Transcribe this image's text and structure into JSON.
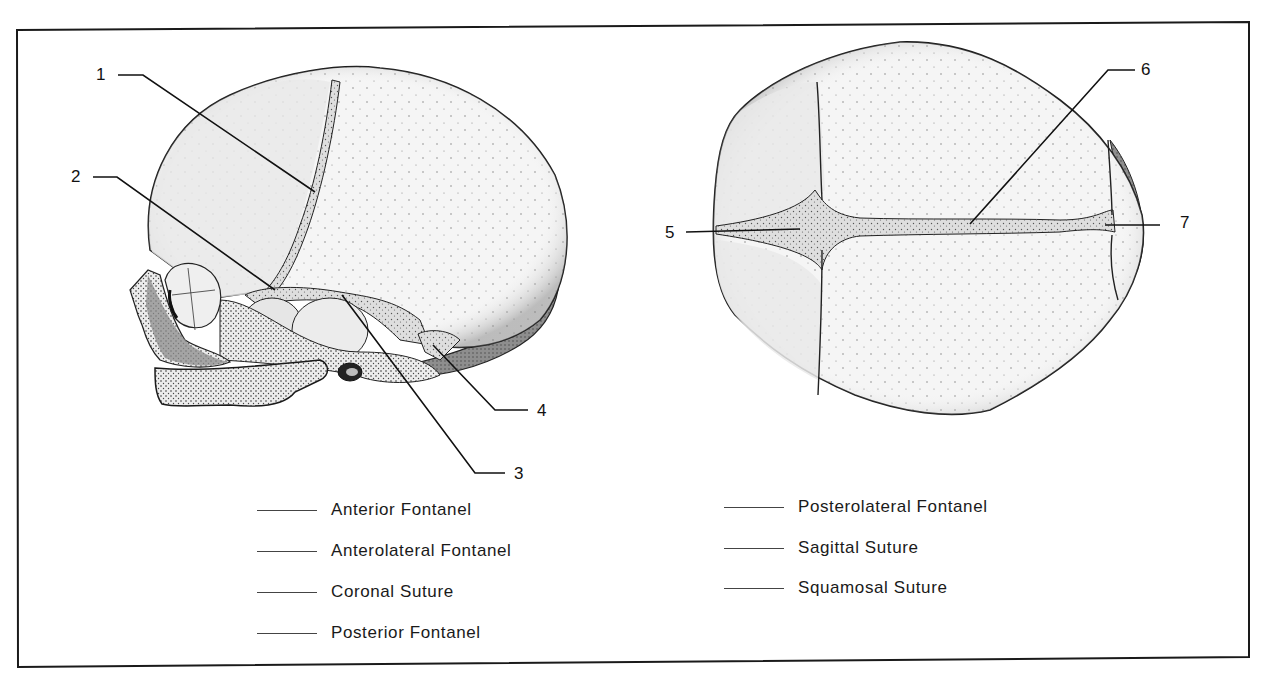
{
  "figure": {
    "views": [
      {
        "id": "lateral",
        "name": "Lateral view of fetal skull"
      },
      {
        "id": "superior",
        "name": "Superior view of fetal skull"
      }
    ],
    "callouts": [
      {
        "number": "1",
        "view": "lateral"
      },
      {
        "number": "2",
        "view": "lateral"
      },
      {
        "number": "3",
        "view": "lateral"
      },
      {
        "number": "4",
        "view": "lateral"
      },
      {
        "number": "5",
        "view": "superior"
      },
      {
        "number": "6",
        "view": "superior"
      },
      {
        "number": "7",
        "view": "superior"
      }
    ]
  },
  "answer_key": {
    "left_column": [
      {
        "blank": "",
        "label": "Anterior Fontanel"
      },
      {
        "blank": "",
        "label": "Anterolateral Fontanel"
      },
      {
        "blank": "",
        "label": "Coronal Suture"
      },
      {
        "blank": "",
        "label": "Posterior Fontanel"
      }
    ],
    "right_column": [
      {
        "blank": "",
        "label": "Posterolateral Fontanel"
      },
      {
        "blank": "",
        "label": "Sagittal Suture"
      },
      {
        "blank": "",
        "label": "Squamosal Suture"
      }
    ]
  },
  "colors": {
    "border": "#1a1a1a",
    "bone_light": "#f3f3f3",
    "bone_shade": "#e2e2e2",
    "suture_fill": "#cfcfcf",
    "dark_shade": "#8a8a8a",
    "line": "#111111"
  }
}
